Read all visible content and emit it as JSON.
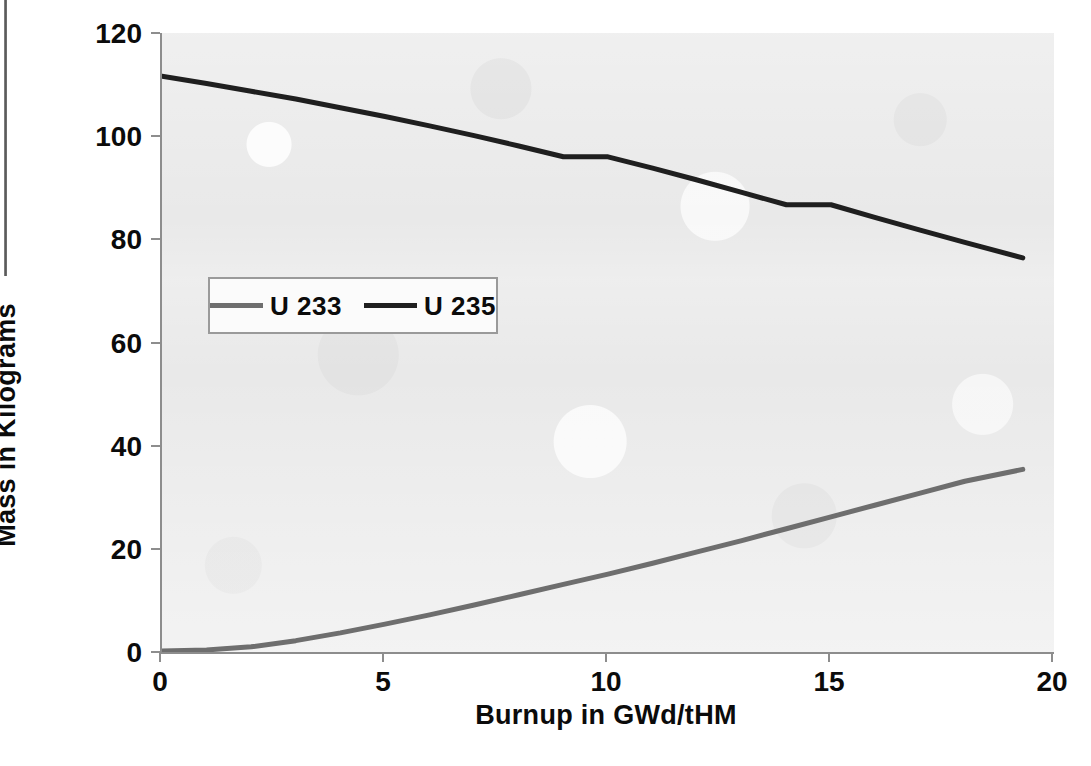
{
  "chart_data": {
    "type": "line",
    "title": "",
    "xlabel": "Burnup in GWd/tHM",
    "ylabel": "Mass in Kilograms",
    "xlim": [
      0,
      20
    ],
    "ylim": [
      0,
      120
    ],
    "xticks": [
      "0",
      "5",
      "10",
      "15",
      "20"
    ],
    "yticks": [
      "0",
      "20",
      "40",
      "60",
      "80",
      "100",
      "120"
    ],
    "xtick_values": [
      0,
      5,
      10,
      15,
      20
    ],
    "ytick_values": [
      0,
      20,
      40,
      60,
      80,
      100,
      120
    ],
    "grid": false,
    "legend_position": "inside-upper-left",
    "plot_background": "#e9e9e9",
    "series": [
      {
        "name": "U 233",
        "color": "#6e6e6e",
        "line_width": 5,
        "x": [
          0,
          1,
          2,
          3,
          4,
          5,
          6,
          7,
          8,
          9,
          10,
          11,
          12,
          13,
          14,
          15,
          16,
          17,
          18,
          19.3
        ],
        "values": [
          0.2,
          0.4,
          1.0,
          2.2,
          3.7,
          5.4,
          7.2,
          9.1,
          11.1,
          13.1,
          15.1,
          17.2,
          19.4,
          21.6,
          23.9,
          26.2,
          28.5,
          30.8,
          33.1,
          35.4
        ]
      },
      {
        "name": "U 235",
        "color": "#1f1f1f",
        "line_width": 5,
        "x": [
          0,
          1,
          2,
          3,
          4,
          5,
          6,
          7,
          8,
          9,
          10,
          11,
          12,
          13,
          14,
          15,
          16,
          17,
          18,
          19.3
        ],
        "values": [
          111.6,
          110.2,
          108.7,
          107.2,
          105.5,
          103.8,
          102.0,
          100.1,
          98.1,
          96.0,
          96.0,
          93.8,
          91.5,
          89.1,
          86.7,
          86.7,
          84.2,
          81.8,
          79.4,
          76.4
        ]
      }
    ]
  },
  "axis": {
    "y_title": "Mass in Kilograms",
    "x_title": "Burnup in GWd/tHM",
    "y_labels": [
      "120",
      "100",
      "80",
      "60",
      "40",
      "20",
      "0"
    ],
    "x_labels": [
      "0",
      "5",
      "10",
      "15",
      "20"
    ]
  },
  "legend": {
    "entries": [
      {
        "label": "U 233",
        "color": "#6e6e6e"
      },
      {
        "label": "U 235",
        "color": "#1f1f1f"
      }
    ]
  }
}
